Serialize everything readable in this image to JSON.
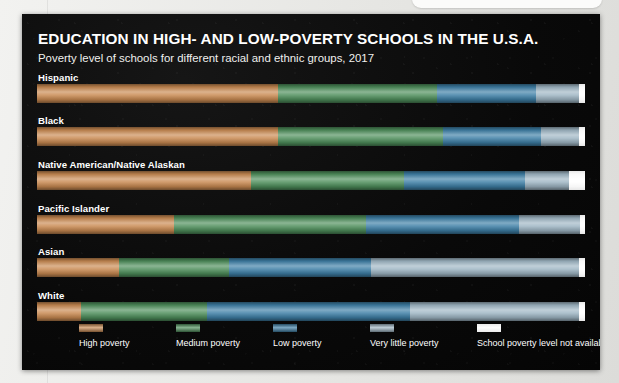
{
  "panel": {
    "title": "EDUCATION IN HIGH- AND LOW-POVERTY SCHOOLS IN THE U.S.A.",
    "subtitle": "Poverty level of schools for different racial and ethnic groups, 2017",
    "background_color": "#0a0a0a",
    "text_color": "#ffffff"
  },
  "chart_data": {
    "type": "bar",
    "orientation": "horizontal",
    "stacked": true,
    "stacked_percent": true,
    "title": "EDUCATION IN HIGH- AND LOW-POVERTY SCHOOLS IN THE U.S.A.",
    "subtitle": "Poverty level of schools for different racial and ethnic groups, 2017",
    "xlabel": "",
    "ylabel": "",
    "xlim": [
      0,
      100
    ],
    "grid": false,
    "legend_position": "bottom",
    "categories": [
      "Hispanic",
      "Black",
      "Native American/Native Alaskan",
      "Pacific Islander",
      "Asian",
      "White"
    ],
    "series": [
      {
        "name": "High poverty",
        "color": "#c98a52",
        "values": [
          44,
          44,
          39,
          25,
          15,
          8
        ]
      },
      {
        "name": "Medium poverty",
        "color": "#4f8f5c",
        "values": [
          29,
          30,
          28,
          35,
          20,
          23
        ]
      },
      {
        "name": "Low poverty",
        "color": "#3e7fa6",
        "values": [
          18,
          18,
          22,
          28,
          26,
          37
        ]
      },
      {
        "name": "Very little poverty",
        "color": "#9fb6c4",
        "values": [
          8,
          7,
          8,
          11,
          38,
          31
        ]
      },
      {
        "name": "School poverty level not available",
        "color": "#ffffff",
        "values": [
          1,
          1,
          3,
          1,
          1,
          1
        ]
      }
    ],
    "rows": [
      {
        "label": "Hispanic",
        "segments": [
          {
            "series": "High poverty",
            "value": 44
          },
          {
            "series": "Medium poverty",
            "value": 29
          },
          {
            "series": "Low poverty",
            "value": 18
          },
          {
            "series": "Very little poverty",
            "value": 8
          },
          {
            "series": "School poverty level not available",
            "value": 1
          }
        ]
      },
      {
        "label": "Black",
        "segments": [
          {
            "series": "High poverty",
            "value": 44
          },
          {
            "series": "Medium poverty",
            "value": 30
          },
          {
            "series": "Low poverty",
            "value": 18
          },
          {
            "series": "Very little poverty",
            "value": 7
          },
          {
            "series": "School poverty level not available",
            "value": 1
          }
        ]
      },
      {
        "label": "Native American/Native Alaskan",
        "segments": [
          {
            "series": "High poverty",
            "value": 39
          },
          {
            "series": "Medium poverty",
            "value": 28
          },
          {
            "series": "Low poverty",
            "value": 22
          },
          {
            "series": "Very little poverty",
            "value": 8
          },
          {
            "series": "School poverty level not available",
            "value": 3
          }
        ]
      },
      {
        "label": "Pacific Islander",
        "segments": [
          {
            "series": "High poverty",
            "value": 25
          },
          {
            "series": "Medium poverty",
            "value": 35
          },
          {
            "series": "Low poverty",
            "value": 28
          },
          {
            "series": "Very little poverty",
            "value": 11
          },
          {
            "series": "School poverty level not available",
            "value": 1
          }
        ]
      },
      {
        "label": "Asian",
        "segments": [
          {
            "series": "High poverty",
            "value": 15
          },
          {
            "series": "Medium poverty",
            "value": 20
          },
          {
            "series": "Low poverty",
            "value": 26
          },
          {
            "series": "Very little poverty",
            "value": 38
          },
          {
            "series": "School poverty level not available",
            "value": 1
          }
        ]
      },
      {
        "label": "White",
        "segments": [
          {
            "series": "High poverty",
            "value": 8
          },
          {
            "series": "Medium poverty",
            "value": 23
          },
          {
            "series": "Low poverty",
            "value": 37
          },
          {
            "series": "Very little poverty",
            "value": 31
          },
          {
            "series": "School poverty level not available",
            "value": 1
          }
        ]
      }
    ]
  },
  "legend": {
    "items": [
      {
        "label": "High poverty",
        "color": "#c98a52",
        "x": 57
      },
      {
        "label": "Medium poverty",
        "color": "#4f8f5c",
        "x": 154
      },
      {
        "label": "Low poverty",
        "color": "#3e7fa6",
        "x": 251
      },
      {
        "label": "Very little poverty",
        "color": "#9fb6c4",
        "x": 348
      },
      {
        "label": "School poverty level not available",
        "color": "#ffffff",
        "x": 455
      }
    ]
  }
}
